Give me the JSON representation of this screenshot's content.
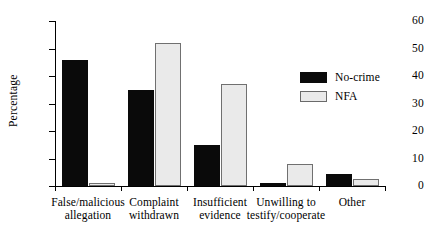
{
  "chart_data": {
    "type": "bar",
    "title": "",
    "subtitle": "",
    "xlabel": "",
    "ylabel": "Percentage",
    "ylim": [
      0,
      60
    ],
    "yticks": [
      0,
      10,
      20,
      30,
      40,
      50,
      60
    ],
    "ytick_labels": [
      "0",
      "10",
      "20",
      "30",
      "40",
      "50",
      "60"
    ],
    "grid": false,
    "legend_position": "upper right",
    "categories": [
      "False/malicious allegation",
      "Complaint withdrawn",
      "Insufficient evidence",
      "Unwilling to testify/cooperate",
      "Other"
    ],
    "category_lines": [
      [
        "False/malicious",
        "allegation"
      ],
      [
        "Complaint",
        "withdrawn"
      ],
      [
        "Insufficient",
        "evidence"
      ],
      [
        "Unwilling to",
        "testify/cooperate"
      ],
      [
        "Other",
        ""
      ]
    ],
    "series": [
      {
        "name": "No-crime",
        "color": "#0a0a0a",
        "values": [
          46,
          35,
          15,
          1,
          4.5
        ]
      },
      {
        "name": "NFA",
        "color": "#eaeaea",
        "border_color": "#707070",
        "values": [
          1,
          52,
          37,
          8,
          2.5
        ]
      }
    ]
  },
  "legend": {
    "entries": [
      {
        "label": "No-crime"
      },
      {
        "label": "NFA"
      }
    ]
  },
  "axis": {
    "y_title": "Percentage",
    "y_tick_labels": [
      "60",
      "50",
      "40",
      "30",
      "20",
      "10",
      "0"
    ]
  }
}
